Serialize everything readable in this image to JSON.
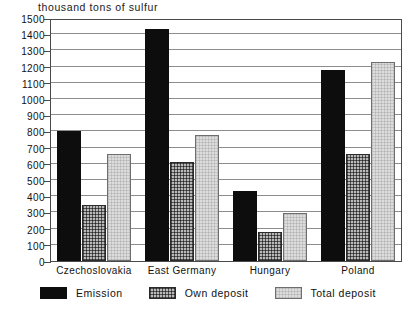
{
  "chart_data": {
    "type": "bar",
    "title": "thousand tons of sulfur",
    "xlabel": "",
    "ylabel": "thousand tons of sulfur",
    "ylim": [
      0,
      1500
    ],
    "ytick_step": 100,
    "yticks": [
      0,
      100,
      200,
      300,
      400,
      500,
      600,
      700,
      800,
      900,
      1000,
      1100,
      1200,
      1300,
      1400,
      1500
    ],
    "ytick_labels": [
      "0",
      "100",
      "200",
      "300",
      "400",
      "500",
      "600",
      "700",
      "800",
      "900",
      "1000",
      "1100",
      "1200",
      "1300",
      "1400",
      "1500"
    ],
    "categories": [
      "Czechoslovakia",
      "East Germany",
      "Hungary",
      "Poland"
    ],
    "grid": true,
    "legend_position": "bottom",
    "series": [
      {
        "name": "Emission",
        "values": [
          800,
          1430,
          430,
          1180
        ]
      },
      {
        "name": "Own deposit",
        "values": [
          345,
          610,
          180,
          660
        ]
      },
      {
        "name": "Total deposit",
        "values": [
          660,
          780,
          295,
          1230
        ]
      }
    ],
    "colors": {
      "emission": "#0d0d0d",
      "own_deposit": "#b9b9b9",
      "total_deposit": "#dcdcdc",
      "axis": "#4a4a4a",
      "gridline": "#8d8d8d",
      "background": "#ffffff"
    }
  }
}
